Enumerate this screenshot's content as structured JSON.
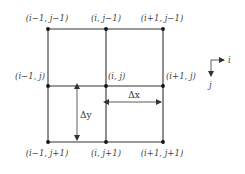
{
  "diagram": {
    "title": "",
    "nodes": [
      {
        "id": "n00",
        "label": "(i−1, j−1)",
        "x": 48,
        "y": 29
      },
      {
        "id": "n10",
        "label": "(i, j−1)",
        "x": 106,
        "y": 29
      },
      {
        "id": "n20",
        "label": "(i+1, j−1)",
        "x": 163,
        "y": 29
      },
      {
        "id": "n01",
        "label": "(i−1, j)",
        "x": 48,
        "y": 86
      },
      {
        "id": "n11",
        "label": "(i, j)",
        "x": 106,
        "y": 86
      },
      {
        "id": "n21",
        "label": "(i+1, j)",
        "x": 163,
        "y": 86
      },
      {
        "id": "n02",
        "label": "(i−1, j+1)",
        "x": 48,
        "y": 142
      },
      {
        "id": "n12",
        "label": "(i, j+1)",
        "x": 106,
        "y": 142
      },
      {
        "id": "n22",
        "label": "(i+1, j+1)",
        "x": 163,
        "y": 142
      }
    ],
    "dimensions": {
      "dx_label": "Δx",
      "dy_label": "Δy"
    },
    "axes": {
      "i_label": "i",
      "j_label": "j"
    }
  }
}
